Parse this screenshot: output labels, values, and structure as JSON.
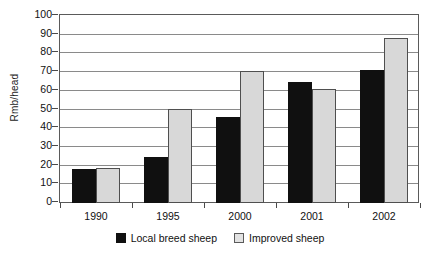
{
  "chart_data": {
    "type": "bar",
    "title": "",
    "xlabel": "",
    "ylabel": "Rmb/head",
    "categories": [
      "1990",
      "1995",
      "2000",
      "2001",
      "2002"
    ],
    "series": [
      {
        "name": "Local breed sheep",
        "color": "#101010",
        "values": [
          18,
          24.5,
          46,
          65,
          71
        ]
      },
      {
        "name": "Improved sheep",
        "color": "#d8d8d8",
        "values": [
          19,
          50.5,
          70.5,
          61,
          88
        ]
      }
    ],
    "ylim": [
      0,
      100
    ],
    "yticks": [
      0,
      10,
      20,
      30,
      40,
      50,
      60,
      70,
      80,
      90,
      100
    ],
    "ytick_labels": [
      "0",
      "10",
      "20",
      "30",
      "40",
      "50",
      "60",
      "70",
      "80",
      "90",
      "100"
    ],
    "grid": true,
    "legend_position": "bottom-center"
  }
}
